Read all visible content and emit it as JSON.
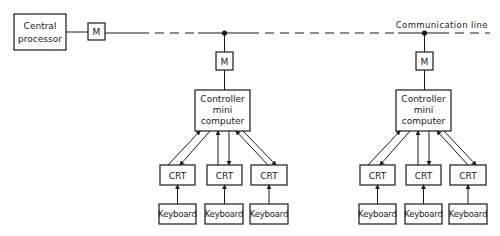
{
  "diagram": {
    "central_processor": {
      "line1": "Central",
      "line2": "processor"
    },
    "modem_label": "M",
    "communication_line_label": "Communication line",
    "clusters": [
      {
        "modem": "M",
        "controller": {
          "line1": "Controller",
          "line2": "mini",
          "line3": "computer"
        },
        "terminals": [
          {
            "crt": "CRT",
            "keyboard": "Keyboard"
          },
          {
            "crt": "CRT",
            "keyboard": "Keyboard"
          },
          {
            "crt": "CRT",
            "keyboard": "Keyboard"
          }
        ]
      },
      {
        "modem": "M",
        "controller": {
          "line1": "Controller",
          "line2": "mini",
          "line3": "computer"
        },
        "terminals": [
          {
            "crt": "CRT",
            "keyboard": "Keyboard"
          },
          {
            "crt": "CRT",
            "keyboard": "Keyboard"
          },
          {
            "crt": "CRT",
            "keyboard": "Keyboard"
          }
        ]
      }
    ]
  }
}
